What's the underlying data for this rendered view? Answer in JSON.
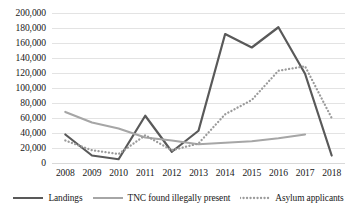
{
  "chart_data": {
    "type": "line",
    "title": "",
    "subtitle": "",
    "xlabel": "",
    "ylabel": "",
    "x": [
      2008,
      2009,
      2010,
      2011,
      2012,
      2013,
      2014,
      2015,
      2016,
      2017,
      2018
    ],
    "categories": [
      "2008",
      "2009",
      "2010",
      "2011",
      "2012",
      "2013",
      "2014",
      "2015",
      "2016",
      "2017",
      "2018"
    ],
    "ylim": [
      0,
      200000
    ],
    "yticks": [
      0,
      20000,
      40000,
      60000,
      80000,
      100000,
      120000,
      140000,
      160000,
      180000,
      200000
    ],
    "ytick_labels": [
      "0",
      "20,000",
      "40,000",
      "60,000",
      "80,000",
      "100,000",
      "120,000",
      "140,000",
      "160,000",
      "180,000",
      "200,000"
    ],
    "grid": true,
    "legend_position": "bottom",
    "series": [
      {
        "name": "Landings",
        "color": "#595959",
        "style": "solid",
        "width": 2.2,
        "values": [
          38000,
          10000,
          5000,
          63000,
          15000,
          43000,
          172000,
          154000,
          181000,
          119000,
          10000
        ]
      },
      {
        "name": "TNC found illegally present",
        "color": "#a6a6a6",
        "style": "solid",
        "width": 2.2,
        "values": [
          68000,
          54000,
          46000,
          34000,
          30000,
          25000,
          27000,
          29000,
          33000,
          38000,
          null
        ]
      },
      {
        "name": "Asylum applicants",
        "color": "#9b9b9b",
        "style": "dotted",
        "width": 2.2,
        "values": [
          30000,
          17000,
          12000,
          37000,
          17000,
          26000,
          65000,
          84000,
          123000,
          129000,
          60000
        ]
      }
    ]
  },
  "colors": {
    "background": "#ffffff",
    "gridline": "#e3e3e3",
    "text": "#202020",
    "landings": "#595959",
    "tnc": "#a6a6a6",
    "asylum": "#9b9b9b"
  }
}
